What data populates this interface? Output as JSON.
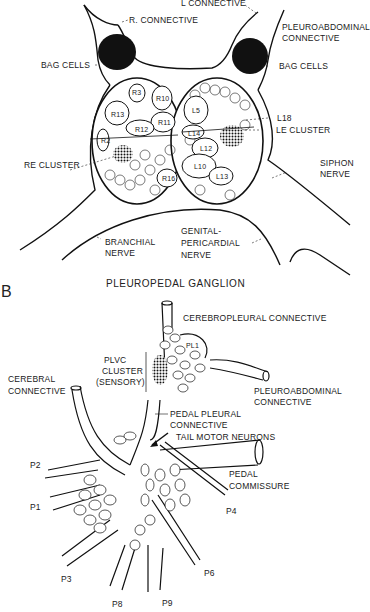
{
  "panelA": {
    "labels": {
      "l_connective": "L CONNECTIVE",
      "r_connective": "R. CONNECTIVE",
      "pleuroabdominal_1": "PLEUROABDOMINAL",
      "pleuroabdominal_2": "CONNECTIVE",
      "bag_cells_left": "BAG CELLS",
      "bag_cells_right": "BAG CELLS",
      "l18": "L18",
      "le_cluster": "LE CLUSTER",
      "re_cluster": "RE CLUSTER",
      "siphon_1": "SIPHON",
      "siphon_2": "NERVE",
      "branchial_1": "BRANCHIAL",
      "branchial_2": "NERVE",
      "genital_1": "GENITAL-",
      "genital_2": "PERICARDIAL",
      "genital_3": "NERVE"
    },
    "neurons": {
      "r3": "R3",
      "r10": "R10",
      "r13": "R13",
      "r11": "R11",
      "r12": "R12",
      "r2": "R2",
      "r16": "R16",
      "l5": "L5",
      "l14": "L14",
      "l12": "L12",
      "l10": "L10",
      "l13": "L13",
      "l11": "L11",
      "l7": "L7",
      "l8": "L8",
      "l9": "L9"
    }
  },
  "panelB": {
    "letter": "B",
    "title": "PLEUROPEDAL GANGLION",
    "labels": {
      "cerebropleural": "CEREBROPLEURAL CONNECTIVE",
      "pl1": "PL1",
      "plvc_1": "PLVC",
      "plvc_2": "CLUSTER",
      "plvc_3": "(SENSORY)",
      "cerebral_1": "CEREBRAL",
      "cerebral_2": "CONNECTIVE",
      "pleuroabdominal_1": "PLEUROABDOMINAL",
      "pleuroabdominal_2": "CONNECTIVE",
      "pedal_pleural_1": "PEDAL PLEURAL",
      "pedal_pleural_2": "CONNECTIVE",
      "tail_motor": "TAIL MOTOR NEURONS",
      "pedal_commissure_1": "PEDAL",
      "pedal_commissure_2": "COMMISSURE",
      "p1": "P1",
      "p2": "P2",
      "p3": "P3",
      "p4": "P4",
      "p6": "P6",
      "p8": "P8",
      "p9": "P9"
    }
  }
}
